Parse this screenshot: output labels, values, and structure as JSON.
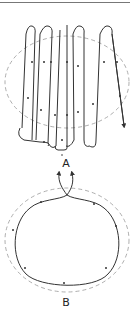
{
  "figure": {
    "panel_a": {
      "label": "A",
      "description": "Serpentine (boustrophedon) scanning path over a dashed elliptical target region"
    },
    "panel_b": {
      "label": "B",
      "description": "Single closed elliptical path inside a dashed elliptical boundary, entering and exiting at a crossing point at the top"
    }
  },
  "colors": {
    "path_stroke": "#333333",
    "boundary_dash": "#999999",
    "divider": "#777777"
  }
}
